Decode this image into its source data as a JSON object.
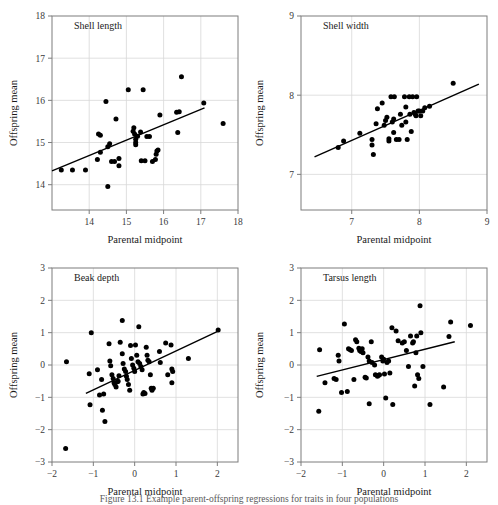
{
  "figure": {
    "caption": "Figure 13.1  Example parent-offspring regressions for traits in four populations",
    "shared": {
      "xlabel": "Parental midpoint",
      "ylabel": "Offspring mean"
    }
  },
  "chart_data": [
    {
      "type": "scatter",
      "title": "Shell length",
      "xlabel": "Parental midpoint",
      "ylabel": "Offspring mean",
      "xlim": [
        13.0,
        18.0
      ],
      "ylim": [
        13.4,
        18.0
      ],
      "xticks": [
        14,
        15,
        16,
        17,
        18
      ],
      "yticks": [
        14,
        15,
        16,
        17,
        18
      ],
      "grid": true,
      "legend": "none",
      "fit_line": {
        "x1": 13.0,
        "y1": 14.33,
        "x2": 17.1,
        "y2": 15.82
      },
      "points": [
        [
          13.25,
          14.35
        ],
        [
          13.55,
          14.35
        ],
        [
          13.9,
          14.35
        ],
        [
          14.25,
          15.2
        ],
        [
          14.3,
          15.17
        ],
        [
          14.22,
          14.6
        ],
        [
          14.3,
          14.77
        ],
        [
          14.45,
          15.97
        ],
        [
          14.5,
          14.9
        ],
        [
          14.55,
          14.97
        ],
        [
          14.5,
          13.96
        ],
        [
          14.6,
          14.55
        ],
        [
          14.68,
          14.55
        ],
        [
          14.72,
          15.56
        ],
        [
          14.8,
          14.62
        ],
        [
          14.8,
          14.45
        ],
        [
          15.05,
          16.25
        ],
        [
          15.18,
          15.27
        ],
        [
          15.2,
          15.35
        ],
        [
          15.22,
          15.2
        ],
        [
          15.25,
          15.08
        ],
        [
          15.25,
          15.0
        ],
        [
          15.25,
          14.95
        ],
        [
          15.3,
          15.15
        ],
        [
          15.38,
          15.25
        ],
        [
          15.45,
          16.25
        ],
        [
          15.4,
          14.57
        ],
        [
          15.5,
          14.57
        ],
        [
          15.55,
          15.14
        ],
        [
          15.62,
          15.14
        ],
        [
          15.7,
          14.55
        ],
        [
          15.78,
          14.6
        ],
        [
          15.8,
          14.72
        ],
        [
          15.82,
          14.8
        ],
        [
          15.85,
          14.82
        ],
        [
          15.9,
          15.65
        ],
        [
          16.35,
          15.72
        ],
        [
          16.42,
          15.73
        ],
        [
          16.38,
          15.24
        ],
        [
          16.48,
          16.56
        ],
        [
          17.08,
          15.94
        ],
        [
          17.6,
          15.45
        ]
      ]
    },
    {
      "type": "scatter",
      "title": "Shell width",
      "xlabel": "Parental midpoint",
      "ylabel": "Offspring mean",
      "xlim": [
        6.25,
        9.0
      ],
      "ylim": [
        6.55,
        9.0
      ],
      "xticks": [
        7,
        8,
        9
      ],
      "yticks": [
        7,
        8,
        9
      ],
      "grid": true,
      "legend": "none",
      "fit_line": {
        "x1": 6.45,
        "y1": 7.22,
        "x2": 8.88,
        "y2": 8.14
      },
      "points": [
        [
          6.8,
          7.34
        ],
        [
          6.88,
          7.42
        ],
        [
          7.12,
          7.52
        ],
        [
          7.3,
          7.44
        ],
        [
          7.3,
          7.37
        ],
        [
          7.32,
          7.25
        ],
        [
          7.36,
          7.64
        ],
        [
          7.38,
          7.83
        ],
        [
          7.45,
          7.9
        ],
        [
          7.48,
          7.62
        ],
        [
          7.5,
          7.68
        ],
        [
          7.52,
          7.72
        ],
        [
          7.55,
          7.45
        ],
        [
          7.55,
          7.42
        ],
        [
          7.58,
          7.98
        ],
        [
          7.6,
          7.66
        ],
        [
          7.62,
          7.7
        ],
        [
          7.63,
          7.98
        ],
        [
          7.62,
          7.53
        ],
        [
          7.66,
          7.44
        ],
        [
          7.7,
          7.44
        ],
        [
          7.72,
          7.76
        ],
        [
          7.74,
          7.62
        ],
        [
          7.78,
          7.98
        ],
        [
          7.8,
          7.85
        ],
        [
          7.8,
          7.66
        ],
        [
          7.82,
          7.44
        ],
        [
          7.85,
          7.98
        ],
        [
          7.86,
          7.76
        ],
        [
          7.88,
          7.54
        ],
        [
          7.9,
          7.98
        ],
        [
          7.92,
          7.78
        ],
        [
          7.94,
          7.76
        ],
        [
          7.95,
          7.74
        ],
        [
          7.96,
          7.98
        ],
        [
          7.98,
          7.8
        ],
        [
          8.0,
          7.8
        ],
        [
          8.02,
          7.74
        ],
        [
          8.05,
          7.8
        ],
        [
          8.08,
          7.84
        ],
        [
          8.15,
          7.86
        ],
        [
          8.5,
          8.15
        ]
      ]
    },
    {
      "type": "scatter",
      "title": "Beak depth",
      "xlabel": "Parental midpoint",
      "ylabel": "Offspring mean",
      "xlim": [
        -2.0,
        2.5
      ],
      "ylim": [
        -3.0,
        3.0
      ],
      "xticks": [
        -2,
        -1,
        0,
        1,
        2
      ],
      "yticks": [
        -3,
        -2,
        -1,
        0,
        1,
        2,
        3
      ],
      "grid": true,
      "legend": "none",
      "fit_line": {
        "x1": -1.18,
        "y1": -0.88,
        "x2": 2.02,
        "y2": 1.05
      },
      "points": [
        [
          -1.65,
          0.1
        ],
        [
          -1.67,
          -2.58
        ],
        [
          -1.1,
          -0.27
        ],
        [
          -1.05,
          1.0
        ],
        [
          -1.08,
          -1.23
        ],
        [
          -0.9,
          -0.15
        ],
        [
          -0.85,
          -0.93
        ],
        [
          -0.8,
          -0.45
        ],
        [
          -0.78,
          -1.4
        ],
        [
          -0.75,
          -0.9
        ],
        [
          -0.72,
          -1.75
        ],
        [
          -0.62,
          0.66
        ],
        [
          -0.6,
          0.12
        ],
        [
          -0.58,
          -0.02
        ],
        [
          -0.55,
          -0.3
        ],
        [
          -0.52,
          -0.42
        ],
        [
          -0.5,
          -0.55
        ],
        [
          -0.48,
          -0.6
        ],
        [
          -0.45,
          -0.68
        ],
        [
          -0.42,
          -0.52
        ],
        [
          -0.4,
          -0.5
        ],
        [
          -0.38,
          -0.33
        ],
        [
          -0.35,
          0.7
        ],
        [
          -0.3,
          1.38
        ],
        [
          -0.3,
          0.35
        ],
        [
          -0.28,
          0.05
        ],
        [
          -0.25,
          -0.12
        ],
        [
          -0.22,
          -0.2
        ],
        [
          -0.2,
          -0.35
        ],
        [
          -0.18,
          -0.45
        ],
        [
          -0.15,
          -0.6
        ],
        [
          -0.12,
          -0.78
        ],
        [
          -0.1,
          0.6
        ],
        [
          -0.08,
          0.2
        ],
        [
          -0.05,
          0.0
        ],
        [
          -0.02,
          -0.1
        ],
        [
          0.0,
          -0.2
        ],
        [
          0.02,
          0.62
        ],
        [
          0.05,
          0.3
        ],
        [
          0.08,
          0.1
        ],
        [
          0.1,
          1.18
        ],
        [
          0.12,
          0.05
        ],
        [
          0.15,
          -0.05
        ],
        [
          0.18,
          -0.15
        ],
        [
          0.2,
          -0.9
        ],
        [
          0.22,
          -0.85
        ],
        [
          0.25,
          -0.88
        ],
        [
          0.28,
          0.55
        ],
        [
          0.3,
          0.3
        ],
        [
          0.32,
          0.15
        ],
        [
          0.35,
          0.1
        ],
        [
          0.38,
          -0.3
        ],
        [
          0.4,
          -0.72
        ],
        [
          0.42,
          -0.78
        ],
        [
          0.45,
          -0.72
        ],
        [
          0.6,
          0.42
        ],
        [
          0.62,
          0.08
        ],
        [
          0.75,
          0.68
        ],
        [
          0.8,
          -0.3
        ],
        [
          0.88,
          0.62
        ],
        [
          0.9,
          -0.12
        ],
        [
          0.92,
          -0.2
        ],
        [
          0.9,
          -0.55
        ],
        [
          1.3,
          0.2
        ],
        [
          2.02,
          1.08
        ]
      ]
    },
    {
      "type": "scatter",
      "title": "Tarsus length",
      "xlabel": "Parental midpoint",
      "ylabel": "Offspring mean",
      "xlim": [
        -2.0,
        2.5
      ],
      "ylim": [
        -3.0,
        3.0
      ],
      "xticks": [
        -2,
        -1,
        0,
        1,
        2
      ],
      "yticks": [
        -3,
        -2,
        -1,
        0,
        1,
        2,
        3
      ],
      "grid": true,
      "legend": "none",
      "fit_line": {
        "x1": -1.62,
        "y1": -0.35,
        "x2": 1.72,
        "y2": 0.72
      },
      "points": [
        [
          -1.55,
          0.47
        ],
        [
          -1.57,
          -1.43
        ],
        [
          -1.42,
          -0.55
        ],
        [
          -1.2,
          -0.42
        ],
        [
          -1.15,
          -0.45
        ],
        [
          -1.1,
          0.3
        ],
        [
          -1.08,
          0.12
        ],
        [
          -0.95,
          1.27
        ],
        [
          -1.02,
          -0.85
        ],
        [
          -0.88,
          -0.82
        ],
        [
          -0.85,
          0.5
        ],
        [
          -0.82,
          0.48
        ],
        [
          -0.78,
          0.45
        ],
        [
          -0.72,
          -0.45
        ],
        [
          -0.68,
          0.78
        ],
        [
          -0.65,
          0.72
        ],
        [
          -0.6,
          0.52
        ],
        [
          -0.58,
          0.45
        ],
        [
          -0.55,
          0.42
        ],
        [
          -0.52,
          0.5
        ],
        [
          -0.5,
          0.38
        ],
        [
          -0.45,
          -0.38
        ],
        [
          -0.42,
          -0.4
        ],
        [
          -0.38,
          0.25
        ],
        [
          -0.35,
          0.12
        ],
        [
          -0.35,
          -1.2
        ],
        [
          -0.3,
          0.72
        ],
        [
          -0.28,
          0.08
        ],
        [
          -0.22,
          0.0
        ],
        [
          -0.2,
          -0.3
        ],
        [
          -0.15,
          -0.35
        ],
        [
          -0.12,
          -0.32
        ],
        [
          -0.1,
          -0.3
        ],
        [
          -0.05,
          0.25
        ],
        [
          -0.02,
          0.12
        ],
        [
          0.0,
          0.18
        ],
        [
          0.02,
          -0.28
        ],
        [
          0.05,
          -1.02
        ],
        [
          0.08,
          0.08
        ],
        [
          0.12,
          0.12
        ],
        [
          0.15,
          -0.25
        ],
        [
          0.2,
          1.15
        ],
        [
          0.22,
          -1.22
        ],
        [
          0.3,
          1.05
        ],
        [
          0.35,
          0.75
        ],
        [
          0.45,
          0.68
        ],
        [
          0.5,
          0.72
        ],
        [
          0.55,
          0.45
        ],
        [
          0.6,
          -0.05
        ],
        [
          0.65,
          0.9
        ],
        [
          0.7,
          0.68
        ],
        [
          0.72,
          0.72
        ],
        [
          0.75,
          -0.65
        ],
        [
          0.78,
          0.38
        ],
        [
          0.8,
          0.9
        ],
        [
          0.82,
          -0.3
        ],
        [
          0.85,
          -0.42
        ],
        [
          0.88,
          1.83
        ],
        [
          0.9,
          1.0
        ],
        [
          0.95,
          -0.05
        ],
        [
          1.12,
          -1.22
        ],
        [
          1.45,
          -0.68
        ],
        [
          1.58,
          0.88
        ],
        [
          1.62,
          1.33
        ],
        [
          2.1,
          1.22
        ]
      ]
    }
  ]
}
